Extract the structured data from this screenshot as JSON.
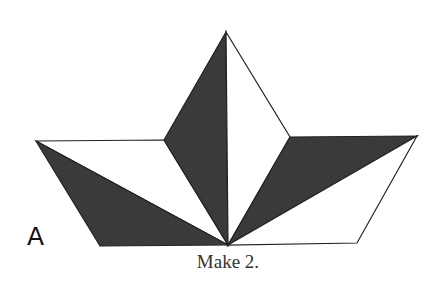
{
  "diagram": {
    "block_label": "A",
    "caption": "Make 2.",
    "colors": {
      "dark": "#3a3a3a",
      "light": "#ffffff",
      "stroke": "#222222"
    },
    "vertices": {
      "apex": [
        226,
        32
      ],
      "left_outer": [
        36,
        141
      ],
      "left_inner": [
        164,
        140
      ],
      "right_inner": [
        290,
        137
      ],
      "right_outer": [
        417,
        136
      ],
      "bottom_left": [
        100,
        246
      ],
      "bottom_right": [
        357,
        243
      ],
      "center_bottom": [
        228,
        245
      ]
    },
    "pieces": [
      {
        "name": "left-light-triangle",
        "fill": "light",
        "points": [
          "left_outer",
          "left_inner",
          "center_bottom"
        ]
      },
      {
        "name": "left-dark-triangle",
        "fill": "dark",
        "points": [
          "left_outer",
          "center_bottom",
          "bottom_left"
        ]
      },
      {
        "name": "top-left-dark-triangle",
        "fill": "dark",
        "points": [
          "apex",
          "left_inner",
          "center_bottom"
        ]
      },
      {
        "name": "top-right-light-triangle",
        "fill": "light",
        "points": [
          "apex",
          "right_inner",
          "center_bottom"
        ]
      },
      {
        "name": "right-dark-triangle",
        "fill": "dark",
        "points": [
          "right_inner",
          "right_outer",
          "center_bottom"
        ]
      },
      {
        "name": "right-light-triangle",
        "fill": "light",
        "points": [
          "right_outer",
          "bottom_right",
          "center_bottom"
        ]
      }
    ]
  }
}
